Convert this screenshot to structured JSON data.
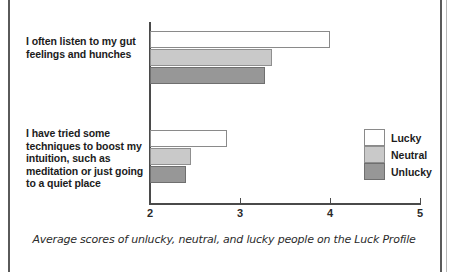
{
  "figure": {
    "caption": "Average scores of unlucky, neutral, and lucky people on the Luck Profile"
  },
  "chart_data": {
    "type": "bar",
    "orientation": "horizontal",
    "title": "",
    "xlabel": "",
    "ylabel": "",
    "xlim": [
      2,
      5
    ],
    "xticks": [
      2,
      3,
      4,
      5
    ],
    "xtick_labels": [
      "2",
      "3",
      "4",
      "5"
    ],
    "grid": false,
    "legend_position": "center-right",
    "categories": [
      "I often listen to my gut feelings and hunches",
      "I have tried some techniques to boost my intuition, such as meditation or just going to a quiet place"
    ],
    "series": [
      {
        "name": "Lucky",
        "color": "#ffffff",
        "values": [
          4.0,
          2.86
        ]
      },
      {
        "name": "Neutral",
        "color": "#c9c9c9",
        "values": [
          3.35,
          2.46
        ]
      },
      {
        "name": "Unlucky",
        "color": "#979797",
        "values": [
          3.28,
          2.4
        ]
      }
    ]
  },
  "axis": {
    "ticks": [
      {
        "label": "2",
        "value": 2
      },
      {
        "label": "3",
        "value": 3
      },
      {
        "label": "4",
        "value": 4
      },
      {
        "label": "5",
        "value": 5
      }
    ]
  },
  "category_labels": [
    "I often listen to my gut feelings and hunches",
    "I have tried some techniques to boost my intuition, such as meditation or just going to a quiet place"
  ],
  "legend": {
    "items": [
      {
        "label": "Lucky",
        "color": "#ffffff"
      },
      {
        "label": "Neutral",
        "color": "#c9c9c9"
      },
      {
        "label": "Unlucky",
        "color": "#979797"
      }
    ]
  }
}
